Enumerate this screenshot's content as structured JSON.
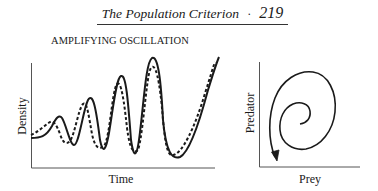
{
  "header": {
    "title": "The Population Criterion",
    "separator": "·",
    "page_number": "219"
  },
  "figure": {
    "title": "AMPLIFYING OSCILLATION",
    "left_panel": {
      "xlabel": "Time",
      "ylabel": "Density",
      "series": [
        {
          "name": "solid curve",
          "style": "solid"
        },
        {
          "name": "dashed curve",
          "style": "dashed"
        }
      ]
    },
    "right_panel": {
      "xlabel": "Prey",
      "ylabel": "Predator",
      "curve": "outward spiral ending in arrow"
    }
  },
  "colors": {
    "ink": "#1a1a1a",
    "background": "#ffffff"
  }
}
